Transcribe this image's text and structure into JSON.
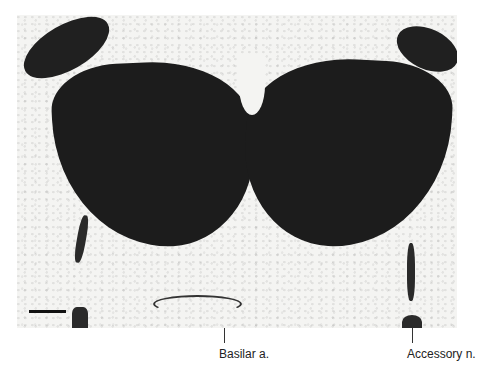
{
  "figure": {
    "type": "histology-micrograph",
    "scale_bar": {
      "visible": true
    },
    "labels": [
      {
        "id": "basilar",
        "text": "Basilar a."
      },
      {
        "id": "accessory",
        "text": "Accessory n."
      }
    ]
  }
}
